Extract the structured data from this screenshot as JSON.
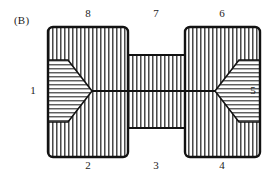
{
  "figure": {
    "panel_label": "(B)",
    "type": "engineering-cross-section-diagram",
    "stroke_color": "#121212",
    "hatch_color": "#2a2a2a",
    "background_color": "#ffffff"
  },
  "callouts": {
    "top": [
      {
        "id": "callout-8",
        "label": "8",
        "x": 88,
        "region": "left-block-upper"
      },
      {
        "id": "callout-7",
        "label": "7",
        "x": 156,
        "region": "middle-bar-top"
      },
      {
        "id": "callout-6",
        "label": "6",
        "x": 222,
        "region": "right-block-upper"
      }
    ],
    "bottom": [
      {
        "id": "callout-2",
        "label": "2",
        "x": 88,
        "region": "left-block-lower"
      },
      {
        "id": "callout-3",
        "label": "3",
        "x": 156,
        "region": "middle-bar-bottom"
      },
      {
        "id": "callout-4",
        "label": "4",
        "x": 222,
        "region": "right-block-lower"
      }
    ],
    "left": {
      "id": "callout-1",
      "label": "1",
      "x": 33,
      "region": "left-block-outer-face"
    },
    "right": {
      "id": "callout-5",
      "label": "5",
      "x": 252,
      "region": "right-block-outer-face"
    }
  },
  "geometry": {
    "left_block": {
      "x": 48,
      "y": 27,
      "width": 80,
      "height": 130,
      "corner_radius": 5
    },
    "right_block": {
      "x": 185,
      "y": 27,
      "width": 75,
      "height": 130,
      "corner_radius": 5
    },
    "middle_bar": {
      "x": 127,
      "y": 55,
      "width": 59,
      "height": 73
    },
    "center_line_y": 91,
    "left_wedge": {
      "apex_x": 92,
      "apex_y": 91,
      "base_x": 48,
      "top_y": 60,
      "bottom_y": 122,
      "notch_x": 68
    },
    "right_wedge": {
      "apex_x": 215,
      "apex_y": 91,
      "base_x": 260,
      "top_y": 60,
      "bottom_y": 122,
      "notch_x": 239
    },
    "hatch_spacing_vertical": 4,
    "hatch_spacing_horizontal": 4
  }
}
